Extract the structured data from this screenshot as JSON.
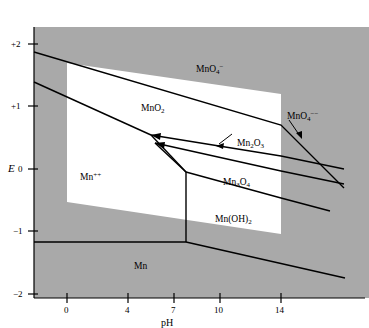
{
  "figure": {
    "background_color": "#a9a9a9",
    "stable_region_color": "#ffffff",
    "line_color": "#000000"
  },
  "axes": {
    "x": {
      "label": "pH",
      "ticks": [
        "0",
        "4",
        "7",
        "10",
        "14"
      ],
      "tick_values": [
        0,
        4,
        7,
        10,
        14
      ],
      "range": [
        -1.3,
        18.2
      ]
    },
    "y": {
      "label": "E",
      "ticks": [
        "+2",
        "+1",
        "0",
        "−1",
        "−2"
      ],
      "tick_values": [
        2,
        1,
        0,
        -1,
        -2
      ],
      "range": [
        -2,
        2.35
      ]
    }
  },
  "species": [
    {
      "name": "MnO4-",
      "html": "MnO<sub>4</sub><sup>−</sup>",
      "x": 196,
      "y": 64
    },
    {
      "name": "MnO2",
      "html": "MnO<sub>2</sub>",
      "x": 141,
      "y": 104
    },
    {
      "name": "MnO4--",
      "html": "MnO<sub>4</sub><sup>−−</sup>",
      "x": 287,
      "y": 111
    },
    {
      "name": "Mn2O3",
      "html": "Mn<sub>2</sub>O<sub>3</sub>",
      "x": 237,
      "y": 139
    },
    {
      "name": "Mn++",
      "html": "Mn<sup>++</sup>",
      "x": 80,
      "y": 172
    },
    {
      "name": "Mn3O4",
      "html": "Mn<sub>3</sub>O<sub>4</sub>",
      "x": 223,
      "y": 178
    },
    {
      "name": "Mn(OH)2",
      "html": "Mn(OH)<sub>2</sub>",
      "x": 215,
      "y": 215
    },
    {
      "name": "Mn",
      "html": "Mn",
      "x": 134,
      "y": 262
    }
  ],
  "chart_data": {
    "type": "line",
    "title": "",
    "xlabel": "pH",
    "ylabel": "E",
    "xlim": [
      -1.3,
      18.2
    ],
    "ylim": [
      -2,
      2.35
    ],
    "grid": false,
    "legend": "none",
    "annotations": [
      {
        "text": "MnO4-",
        "reads": "MnO4^-",
        "x_pH": 8.5,
        "y_E": 1.55
      },
      {
        "text": "MnO2",
        "reads": "MnO2",
        "x_pH": 4.0,
        "y_E": 1.0
      },
      {
        "text": "MnO4--",
        "reads": "MnO4^2-",
        "x_pH": 15.2,
        "y_E": 0.84,
        "has_leader_arrow": true
      },
      {
        "text": "Mn2O3",
        "reads": "Mn2O3",
        "x_pH": 11.6,
        "y_E": 0.42,
        "has_leader_arrow": true
      },
      {
        "text": "Mn++",
        "reads": "Mn^2+",
        "x_pH": 1.3,
        "y_E": -0.05
      },
      {
        "text": "Mn3O4",
        "reads": "Mn3O4",
        "x_pH": 10.6,
        "y_E": -0.18
      },
      {
        "text": "Mn(OH)2",
        "reads": "Mn(OH)2",
        "x_pH": 10.0,
        "y_E": -0.78
      },
      {
        "text": "Mn",
        "reads": "Mn",
        "x_pH": 4.5,
        "y_E": -1.45
      }
    ],
    "boundaries": [
      {
        "name": "MnO4-/MnO2",
        "points": [
          [
            -1.3,
            1.79
          ],
          [
            14.2,
            0.62
          ],
          [
            18.0,
            0.1
          ]
        ]
      },
      {
        "name": "MnO2/Mn2O3",
        "points": [
          [
            -1.3,
            1.33
          ],
          [
            5.7,
            0.66
          ],
          [
            14.2,
            0.43
          ],
          [
            18.0,
            0.31
          ]
        ]
      },
      {
        "name": "Mn2O3/Mn3O4",
        "points": [
          [
            5.9,
            0.6
          ],
          [
            14.2,
            0.32
          ],
          [
            18.0,
            0.22
          ]
        ]
      },
      {
        "name": "Mn3O4/Mn(OH)2",
        "points": [
          [
            8.1,
            -0.08
          ],
          [
            14.2,
            -0.26
          ],
          [
            17.2,
            -0.35
          ]
        ]
      },
      {
        "name": "Mn++/MnO2 upper",
        "points": [
          [
            -1.3,
            1.33
          ],
          [
            5.7,
            0.66
          ]
        ]
      },
      {
        "name": "Mn++/Mn3O4",
        "points": [
          [
            5.9,
            0.6
          ],
          [
            8.1,
            -0.08
          ]
        ]
      },
      {
        "name": "Mn++/Mn2O3",
        "points": [
          [
            5.7,
            0.66
          ],
          [
            8.1,
            -0.08
          ]
        ]
      },
      {
        "name": "Mn++/Mn boundary vertical",
        "points": [
          [
            8.1,
            -0.08
          ],
          [
            8.1,
            -1.18
          ]
        ]
      },
      {
        "name": "Mn/Mn++ horizontal",
        "points": [
          [
            -1.3,
            -1.18
          ],
          [
            8.1,
            -1.18
          ]
        ]
      },
      {
        "name": "Mn/Mn(OH)2",
        "points": [
          [
            8.1,
            -1.18
          ],
          [
            17.4,
            -1.78
          ]
        ]
      }
    ],
    "water_stability_region": {
      "note": "white quadrilateral marks region of thermodynamic stability of water",
      "vertices_pH_E": [
        [
          0.0,
          1.7
        ],
        [
          14.2,
          0.73
        ],
        [
          14.2,
          -1.33
        ],
        [
          0.0,
          -0.53
        ]
      ]
    }
  }
}
